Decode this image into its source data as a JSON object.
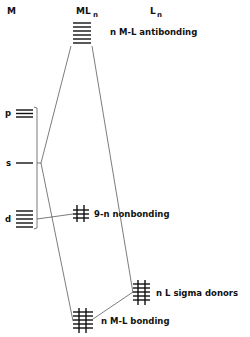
{
  "columns": {
    "metal": "M",
    "complex_main": "ML",
    "complex_sub": "n",
    "ligand_main": "L",
    "ligand_sub": "n"
  },
  "metal_orbitals": [
    {
      "id": "p",
      "label": "p",
      "lines": 3
    },
    {
      "id": "s",
      "label": "s",
      "lines": 1
    },
    {
      "id": "d",
      "label": "d",
      "lines": 5
    }
  ],
  "complex_levels": [
    {
      "id": "antibonding",
      "label": "n  M-L antibonding",
      "lines": 5,
      "filled": false
    },
    {
      "id": "nonbonding",
      "label": "9-n  nonbonding",
      "lines": 3,
      "filled": true
    },
    {
      "id": "bonding",
      "label": "n  M-L bonding",
      "lines": 5,
      "filled": true
    }
  ],
  "ligand_levels": [
    {
      "id": "sigma_donors",
      "label": "n  L  sigma donors",
      "lines": 5,
      "filled": true
    }
  ],
  "colors": {
    "ink": "#111111",
    "connector": "#444444",
    "background": "#ffffff"
  }
}
